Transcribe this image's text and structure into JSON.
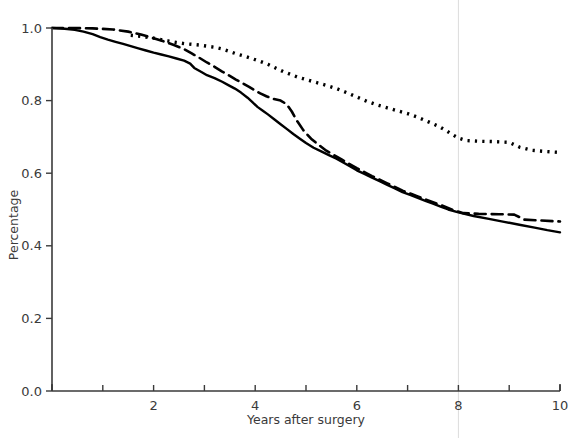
{
  "chart_data": {
    "type": "line",
    "title": "",
    "xlabel": "Years after surgery",
    "ylabel": "Percentage",
    "xlim": [
      0,
      10
    ],
    "ylim": [
      0.0,
      1.0
    ],
    "grid": false,
    "legend_position": "none",
    "x_ticks_major": [
      0,
      2,
      4,
      6,
      8,
      10
    ],
    "x_tick_labels": [
      "",
      "2",
      "4",
      "6",
      "8",
      "10"
    ],
    "x_ticks_minor": [
      1,
      3,
      5,
      7,
      9
    ],
    "y_ticks": [
      0.0,
      0.2,
      0.4,
      0.6,
      0.8,
      1.0
    ],
    "y_tick_labels": [
      "0.0",
      "0.2",
      "0.4",
      "0.6",
      "0.8",
      "1.0"
    ],
    "annotations": [
      {
        "name": "reference-line-year-8",
        "type": "vline",
        "x": 8,
        "color": "#dcdcdc"
      }
    ],
    "series": [
      {
        "name": "solid-curve",
        "style": "solid",
        "color": "#000000",
        "points": [
          [
            0.0,
            1.0
          ],
          [
            0.25,
            0.998
          ],
          [
            0.45,
            0.995
          ],
          [
            0.62,
            0.99
          ],
          [
            0.8,
            0.983
          ],
          [
            0.95,
            0.975
          ],
          [
            1.1,
            0.968
          ],
          [
            1.25,
            0.962
          ],
          [
            1.4,
            0.956
          ],
          [
            1.55,
            0.95
          ],
          [
            1.7,
            0.944
          ],
          [
            1.85,
            0.938
          ],
          [
            2.0,
            0.932
          ],
          [
            2.15,
            0.927
          ],
          [
            2.3,
            0.922
          ],
          [
            2.45,
            0.916
          ],
          [
            2.6,
            0.91
          ],
          [
            2.72,
            0.902
          ],
          [
            2.8,
            0.89
          ],
          [
            2.95,
            0.878
          ],
          [
            3.05,
            0.87
          ],
          [
            3.2,
            0.862
          ],
          [
            3.35,
            0.852
          ],
          [
            3.48,
            0.842
          ],
          [
            3.6,
            0.833
          ],
          [
            3.72,
            0.822
          ],
          [
            3.85,
            0.808
          ],
          [
            3.95,
            0.795
          ],
          [
            4.05,
            0.782
          ],
          [
            4.15,
            0.772
          ],
          [
            4.25,
            0.762
          ],
          [
            4.38,
            0.748
          ],
          [
            4.5,
            0.735
          ],
          [
            4.62,
            0.722
          ],
          [
            4.75,
            0.708
          ],
          [
            4.88,
            0.695
          ],
          [
            5.0,
            0.683
          ],
          [
            5.15,
            0.67
          ],
          [
            5.3,
            0.66
          ],
          [
            5.45,
            0.65
          ],
          [
            5.6,
            0.64
          ],
          [
            5.75,
            0.628
          ],
          [
            5.88,
            0.618
          ],
          [
            6.0,
            0.608
          ],
          [
            6.15,
            0.598
          ],
          [
            6.3,
            0.588
          ],
          [
            6.45,
            0.578
          ],
          [
            6.6,
            0.568
          ],
          [
            6.75,
            0.558
          ],
          [
            6.9,
            0.548
          ],
          [
            7.05,
            0.54
          ],
          [
            7.2,
            0.532
          ],
          [
            7.35,
            0.524
          ],
          [
            7.5,
            0.516
          ],
          [
            7.65,
            0.508
          ],
          [
            7.8,
            0.5
          ],
          [
            8.0,
            0.492
          ],
          [
            8.3,
            0.482
          ],
          [
            8.6,
            0.474
          ],
          [
            8.9,
            0.466
          ],
          [
            9.2,
            0.458
          ],
          [
            9.5,
            0.45
          ],
          [
            9.75,
            0.443
          ],
          [
            10.0,
            0.437
          ]
        ]
      },
      {
        "name": "dashed-curve",
        "style": "dashed",
        "color": "#000000",
        "points": [
          [
            0.0,
            1.0
          ],
          [
            0.4,
            1.0
          ],
          [
            0.8,
            0.999
          ],
          [
            1.2,
            0.996
          ],
          [
            1.5,
            0.99
          ],
          [
            1.75,
            0.982
          ],
          [
            2.0,
            0.972
          ],
          [
            2.2,
            0.963
          ],
          [
            2.4,
            0.953
          ],
          [
            2.6,
            0.942
          ],
          [
            2.75,
            0.93
          ],
          [
            2.9,
            0.918
          ],
          [
            3.05,
            0.905
          ],
          [
            3.2,
            0.893
          ],
          [
            3.35,
            0.88
          ],
          [
            3.5,
            0.868
          ],
          [
            3.62,
            0.858
          ],
          [
            3.75,
            0.848
          ],
          [
            3.88,
            0.838
          ],
          [
            4.0,
            0.828
          ],
          [
            4.1,
            0.82
          ],
          [
            4.22,
            0.812
          ],
          [
            4.35,
            0.805
          ],
          [
            4.5,
            0.8
          ],
          [
            4.62,
            0.79
          ],
          [
            4.72,
            0.77
          ],
          [
            4.82,
            0.745
          ],
          [
            4.95,
            0.718
          ],
          [
            5.1,
            0.695
          ],
          [
            5.25,
            0.678
          ],
          [
            5.4,
            0.662
          ],
          [
            5.55,
            0.65
          ],
          [
            5.7,
            0.638
          ],
          [
            5.85,
            0.626
          ],
          [
            6.0,
            0.614
          ],
          [
            6.15,
            0.603
          ],
          [
            6.3,
            0.592
          ],
          [
            6.45,
            0.582
          ],
          [
            6.6,
            0.572
          ],
          [
            6.75,
            0.562
          ],
          [
            6.9,
            0.552
          ],
          [
            7.05,
            0.544
          ],
          [
            7.2,
            0.536
          ],
          [
            7.35,
            0.528
          ],
          [
            7.5,
            0.52
          ],
          [
            7.7,
            0.51
          ],
          [
            7.9,
            0.498
          ],
          [
            8.1,
            0.49
          ],
          [
            8.4,
            0.488
          ],
          [
            8.8,
            0.487
          ],
          [
            9.1,
            0.486
          ],
          [
            9.3,
            0.472
          ],
          [
            9.6,
            0.47
          ],
          [
            9.85,
            0.468
          ],
          [
            10.0,
            0.467
          ]
        ]
      },
      {
        "name": "dotted-curve",
        "style": "dotted",
        "color": "#000000",
        "points": [
          [
            1.55,
            0.98
          ],
          [
            1.7,
            0.978
          ],
          [
            1.85,
            0.975
          ],
          [
            2.0,
            0.972
          ],
          [
            2.15,
            0.968
          ],
          [
            2.3,
            0.964
          ],
          [
            2.45,
            0.96
          ],
          [
            2.6,
            0.957
          ],
          [
            2.75,
            0.955
          ],
          [
            2.9,
            0.953
          ],
          [
            3.05,
            0.95
          ],
          [
            3.2,
            0.947
          ],
          [
            3.35,
            0.942
          ],
          [
            3.5,
            0.935
          ],
          [
            3.65,
            0.928
          ],
          [
            3.8,
            0.922
          ],
          [
            3.95,
            0.915
          ],
          [
            4.1,
            0.908
          ],
          [
            4.25,
            0.9
          ],
          [
            4.4,
            0.89
          ],
          [
            4.55,
            0.88
          ],
          [
            4.7,
            0.872
          ],
          [
            4.85,
            0.864
          ],
          [
            5.0,
            0.858
          ],
          [
            5.2,
            0.85
          ],
          [
            5.4,
            0.842
          ],
          [
            5.6,
            0.833
          ],
          [
            5.8,
            0.822
          ],
          [
            6.0,
            0.81
          ],
          [
            6.2,
            0.798
          ],
          [
            6.4,
            0.788
          ],
          [
            6.6,
            0.78
          ],
          [
            6.8,
            0.772
          ],
          [
            7.0,
            0.764
          ],
          [
            7.2,
            0.754
          ],
          [
            7.4,
            0.742
          ],
          [
            7.6,
            0.73
          ],
          [
            7.75,
            0.718
          ],
          [
            7.9,
            0.705
          ],
          [
            8.0,
            0.697
          ],
          [
            8.15,
            0.69
          ],
          [
            8.4,
            0.688
          ],
          [
            8.7,
            0.687
          ],
          [
            9.0,
            0.685
          ],
          [
            9.2,
            0.672
          ],
          [
            9.45,
            0.663
          ],
          [
            9.7,
            0.66
          ],
          [
            9.9,
            0.658
          ],
          [
            10.0,
            0.657
          ]
        ]
      }
    ]
  },
  "axes": {
    "x_label": "Years after surgery",
    "y_label": "Percentage"
  }
}
